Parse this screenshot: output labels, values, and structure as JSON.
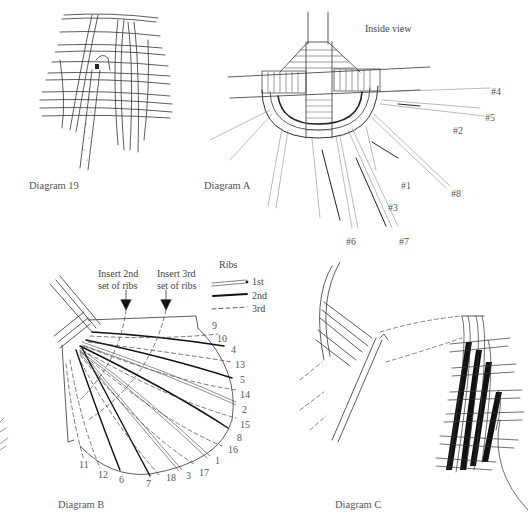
{
  "diagram19": {
    "caption": "Diagram 19"
  },
  "diagramA": {
    "caption": "Diagram A",
    "subtitle": "Inside view",
    "rib_labels": [
      {
        "text": "#4",
        "x": 491,
        "y": 86
      },
      {
        "text": "#5",
        "x": 485,
        "y": 112
      },
      {
        "text": "#2",
        "x": 453,
        "y": 125
      },
      {
        "text": "#1",
        "x": 401,
        "y": 180
      },
      {
        "text": "#8",
        "x": 451,
        "y": 188
      },
      {
        "text": "#3",
        "x": 388,
        "y": 202
      },
      {
        "text": "#6",
        "x": 346,
        "y": 236
      },
      {
        "text": "#7",
        "x": 399,
        "y": 236
      }
    ]
  },
  "diagramB": {
    "caption": "Diagram B",
    "insert2_line1": "Insert 2nd",
    "insert2_line2": "set of ribs",
    "insert3_line1": "Insert 3rd",
    "insert3_line2": "set of ribs",
    "legend": {
      "title": "Ribs",
      "items": [
        {
          "label": "1st",
          "style": "double"
        },
        {
          "label": "2nd",
          "style": "solid"
        },
        {
          "label": "3rd",
          "style": "dashed"
        }
      ]
    },
    "rib_numbers": [
      {
        "text": "9",
        "x": 212,
        "y": 320
      },
      {
        "text": "10",
        "x": 217,
        "y": 333
      },
      {
        "text": "4",
        "x": 231,
        "y": 344
      },
      {
        "text": "13",
        "x": 235,
        "y": 359
      },
      {
        "text": "5",
        "x": 240,
        "y": 374
      },
      {
        "text": "14",
        "x": 240,
        "y": 389
      },
      {
        "text": "2",
        "x": 242,
        "y": 404
      },
      {
        "text": "15",
        "x": 240,
        "y": 419
      },
      {
        "text": "8",
        "x": 237,
        "y": 432
      },
      {
        "text": "16",
        "x": 228,
        "y": 444
      },
      {
        "text": "1",
        "x": 215,
        "y": 455
      },
      {
        "text": "17",
        "x": 199,
        "y": 467
      },
      {
        "text": "3",
        "x": 186,
        "y": 470
      },
      {
        "text": "18",
        "x": 166,
        "y": 472
      },
      {
        "text": "7",
        "x": 146,
        "y": 478
      },
      {
        "text": "6",
        "x": 119,
        "y": 474
      },
      {
        "text": "12",
        "x": 98,
        "y": 469
      },
      {
        "text": "11",
        "x": 79,
        "y": 459
      }
    ]
  },
  "diagramC": {
    "caption": "Diagram C"
  }
}
